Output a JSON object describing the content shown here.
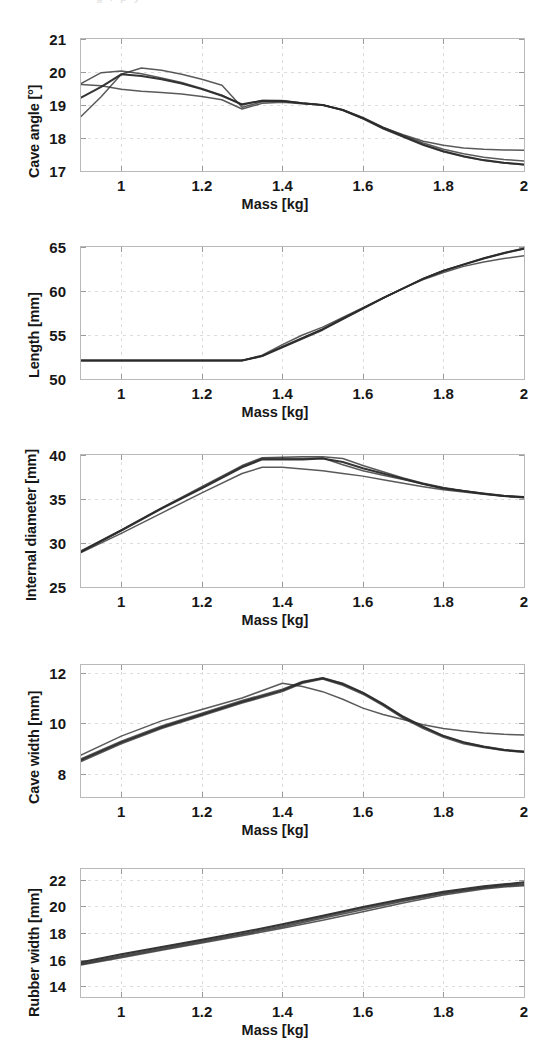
{
  "figure": {
    "scan_remnant": "g    i   p      y",
    "shared_xlabel": "Mass [kg]",
    "x_ticks": [
      "1",
      "1.2",
      "1.4",
      "1.6",
      "1.8",
      "2"
    ],
    "xlim": [
      0.9,
      2.0
    ],
    "line_color": "#2b2b2b",
    "grid_color": "#dcdcdc",
    "axis_color": "#b9b9b9"
  },
  "chart_data": [
    {
      "type": "line",
      "id": "cave-angle",
      "title": "",
      "xlabel": "Mass [kg]",
      "ylabel": "Cave angle [°]",
      "xlim": [
        0.9,
        2.0
      ],
      "ylim": [
        17,
        21
      ],
      "x_ticks": [
        1,
        1.2,
        1.4,
        1.6,
        1.8,
        2
      ],
      "y_ticks": [
        17,
        18,
        19,
        20,
        21
      ],
      "grid": true,
      "legend": "none",
      "x": [
        0.9,
        0.95,
        1.0,
        1.05,
        1.1,
        1.15,
        1.2,
        1.25,
        1.3,
        1.35,
        1.4,
        1.45,
        1.5,
        1.55,
        1.6,
        1.65,
        1.7,
        1.75,
        1.8,
        1.85,
        1.9,
        1.95,
        2.0
      ],
      "series": [
        {
          "name": "run-1",
          "values": [
            19.22,
            19.55,
            19.93,
            19.88,
            19.78,
            19.65,
            19.48,
            19.28,
            19.02,
            19.13,
            19.12,
            19.05,
            19.0,
            18.85,
            18.6,
            18.3,
            18.05,
            17.8,
            17.6,
            17.45,
            17.33,
            17.25,
            17.2
          ]
        },
        {
          "name": "run-2",
          "values": [
            18.65,
            19.25,
            19.93,
            20.12,
            20.05,
            19.93,
            19.78,
            19.6,
            18.93,
            19.1,
            19.12,
            19.05,
            19.0,
            18.85,
            18.6,
            18.32,
            18.1,
            17.9,
            17.78,
            17.7,
            17.66,
            17.64,
            17.63
          ]
        },
        {
          "name": "run-3",
          "values": [
            19.65,
            19.98,
            20.03,
            19.95,
            19.82,
            19.68,
            19.5,
            19.3,
            19.0,
            19.14,
            19.14,
            19.06,
            19.0,
            18.84,
            18.58,
            18.28,
            18.03,
            17.78,
            17.58,
            17.43,
            17.32,
            17.24,
            17.19
          ]
        },
        {
          "name": "run-4",
          "values": [
            19.62,
            19.58,
            19.48,
            19.42,
            19.38,
            19.33,
            19.26,
            19.16,
            18.88,
            19.05,
            19.08,
            19.04,
            19.0,
            18.86,
            18.62,
            18.33,
            18.08,
            17.85,
            17.66,
            17.52,
            17.42,
            17.35,
            17.3
          ]
        }
      ]
    },
    {
      "type": "line",
      "id": "length",
      "title": "",
      "xlabel": "Mass [kg]",
      "ylabel": "Length [mm]",
      "xlim": [
        0.9,
        2.0
      ],
      "ylim": [
        50,
        65
      ],
      "x_ticks": [
        1,
        1.2,
        1.4,
        1.6,
        1.8,
        2
      ],
      "y_ticks": [
        50,
        55,
        60,
        65
      ],
      "grid": true,
      "legend": "none",
      "x": [
        0.9,
        1.0,
        1.1,
        1.2,
        1.3,
        1.35,
        1.4,
        1.45,
        1.5,
        1.55,
        1.6,
        1.65,
        1.7,
        1.75,
        1.8,
        1.85,
        1.9,
        1.95,
        2.0
      ],
      "series": [
        {
          "name": "run-1",
          "values": [
            52.1,
            52.1,
            52.1,
            52.1,
            52.1,
            52.6,
            53.6,
            54.6,
            55.6,
            56.8,
            58.0,
            59.2,
            60.3,
            61.4,
            62.3,
            63.0,
            63.7,
            64.3,
            64.8
          ]
        },
        {
          "name": "run-2",
          "values": [
            52.1,
            52.1,
            52.1,
            52.1,
            52.1,
            52.7,
            53.9,
            55.0,
            55.9,
            57.0,
            58.1,
            59.2,
            60.3,
            61.3,
            62.1,
            62.8,
            63.3,
            63.7,
            64.0
          ]
        },
        {
          "name": "run-3",
          "values": [
            52.1,
            52.1,
            52.1,
            52.1,
            52.1,
            52.6,
            53.7,
            54.7,
            55.7,
            56.9,
            58.05,
            59.2,
            60.3,
            61.4,
            62.3,
            63.0,
            63.7,
            64.3,
            64.8
          ]
        },
        {
          "name": "run-4",
          "values": [
            52.1,
            52.1,
            52.1,
            52.1,
            52.1,
            52.65,
            53.65,
            54.65,
            55.65,
            56.85,
            58.0,
            59.2,
            60.3,
            61.4,
            62.3,
            63.05,
            63.75,
            64.35,
            64.85
          ]
        }
      ]
    },
    {
      "type": "line",
      "id": "internal-diameter",
      "title": "",
      "xlabel": "Mass [kg]",
      "ylabel": "Internal diameter [mm]",
      "xlim": [
        0.9,
        2.0
      ],
      "ylim": [
        25,
        40
      ],
      "x_ticks": [
        1,
        1.2,
        1.4,
        1.6,
        1.8,
        2
      ],
      "y_ticks": [
        25,
        30,
        35,
        40
      ],
      "grid": true,
      "legend": "none",
      "x": [
        0.9,
        1.0,
        1.1,
        1.2,
        1.3,
        1.35,
        1.4,
        1.45,
        1.5,
        1.55,
        1.6,
        1.65,
        1.7,
        1.75,
        1.8,
        1.85,
        1.9,
        1.95,
        2.0
      ],
      "series": [
        {
          "name": "run-1",
          "values": [
            29.0,
            31.4,
            33.9,
            36.2,
            38.6,
            39.5,
            39.5,
            39.5,
            39.6,
            39.2,
            38.5,
            37.9,
            37.3,
            36.7,
            36.2,
            35.9,
            35.6,
            35.35,
            35.2
          ]
        },
        {
          "name": "run-2",
          "values": [
            29.1,
            31.5,
            34.0,
            36.4,
            38.8,
            39.7,
            39.75,
            39.8,
            39.8,
            39.6,
            38.8,
            38.1,
            37.4,
            36.8,
            36.3,
            35.95,
            35.65,
            35.4,
            35.25
          ]
        },
        {
          "name": "run-3",
          "values": [
            28.9,
            31.1,
            33.4,
            35.7,
            37.9,
            38.6,
            38.6,
            38.4,
            38.2,
            37.9,
            37.6,
            37.2,
            36.8,
            36.4,
            36.05,
            35.8,
            35.55,
            35.3,
            35.15
          ]
        },
        {
          "name": "run-4",
          "values": [
            29.05,
            31.45,
            33.95,
            36.3,
            38.7,
            39.6,
            39.6,
            39.6,
            39.65,
            38.9,
            38.2,
            37.7,
            37.2,
            36.7,
            36.25,
            35.9,
            35.6,
            35.35,
            35.2
          ]
        }
      ]
    },
    {
      "type": "line",
      "id": "cave-width",
      "title": "",
      "xlabel": "Mass [kg]",
      "ylabel": "Cave width [mm]",
      "xlim": [
        0.9,
        2.0
      ],
      "ylim": [
        7.1,
        12.3
      ],
      "x_ticks": [
        1,
        1.2,
        1.4,
        1.6,
        1.8,
        2
      ],
      "y_ticks": [
        8,
        10,
        12
      ],
      "grid": true,
      "legend": "none",
      "x": [
        0.9,
        1.0,
        1.1,
        1.2,
        1.3,
        1.4,
        1.45,
        1.5,
        1.55,
        1.6,
        1.65,
        1.7,
        1.75,
        1.8,
        1.85,
        1.9,
        1.95,
        2.0
      ],
      "series": [
        {
          "name": "run-1",
          "values": [
            8.55,
            9.25,
            9.85,
            10.35,
            10.85,
            11.3,
            11.62,
            11.78,
            11.55,
            11.2,
            10.75,
            10.25,
            9.85,
            9.5,
            9.25,
            9.08,
            8.95,
            8.88
          ]
        },
        {
          "name": "run-2",
          "values": [
            8.75,
            9.5,
            10.1,
            10.55,
            11.0,
            11.58,
            11.45,
            11.25,
            10.95,
            10.6,
            10.35,
            10.15,
            9.95,
            9.8,
            9.7,
            9.62,
            9.57,
            9.54
          ]
        },
        {
          "name": "run-3",
          "values": [
            8.5,
            9.2,
            9.8,
            10.3,
            10.8,
            11.25,
            11.58,
            11.75,
            11.5,
            11.15,
            10.7,
            10.2,
            9.8,
            9.45,
            9.2,
            9.05,
            8.93,
            8.86
          ]
        },
        {
          "name": "run-4",
          "values": [
            8.6,
            9.3,
            9.9,
            10.4,
            10.9,
            11.35,
            11.65,
            11.8,
            11.58,
            11.22,
            10.78,
            10.28,
            9.88,
            9.52,
            9.27,
            9.1,
            8.97,
            8.9
          ]
        }
      ]
    },
    {
      "type": "line",
      "id": "rubber-width",
      "title": "",
      "xlabel": "Mass [kg]",
      "ylabel": "Rubber width [mm]",
      "xlim": [
        0.9,
        2.0
      ],
      "ylim": [
        13.2,
        22.8
      ],
      "x_ticks": [
        1,
        1.2,
        1.4,
        1.6,
        1.8,
        2
      ],
      "y_ticks": [
        14,
        16,
        18,
        20,
        22
      ],
      "grid": true,
      "legend": "none",
      "x": [
        0.9,
        1.0,
        1.1,
        1.2,
        1.3,
        1.4,
        1.5,
        1.6,
        1.7,
        1.8,
        1.9,
        1.95,
        2.0
      ],
      "series": [
        {
          "name": "run-1",
          "values": [
            15.8,
            16.4,
            16.95,
            17.5,
            18.05,
            18.65,
            19.3,
            19.95,
            20.55,
            21.1,
            21.5,
            21.65,
            21.8
          ]
        },
        {
          "name": "run-2",
          "values": [
            15.6,
            16.15,
            16.7,
            17.25,
            17.8,
            18.35,
            18.95,
            19.6,
            20.25,
            20.85,
            21.3,
            21.45,
            21.55
          ]
        },
        {
          "name": "run-3",
          "values": [
            15.72,
            16.3,
            16.85,
            17.4,
            17.95,
            18.55,
            19.2,
            19.85,
            20.45,
            21.0,
            21.42,
            21.58,
            21.7
          ]
        },
        {
          "name": "run-4",
          "values": [
            15.65,
            16.22,
            16.78,
            17.32,
            17.88,
            18.45,
            19.1,
            19.75,
            20.38,
            20.95,
            21.38,
            21.52,
            21.62
          ]
        }
      ]
    }
  ]
}
